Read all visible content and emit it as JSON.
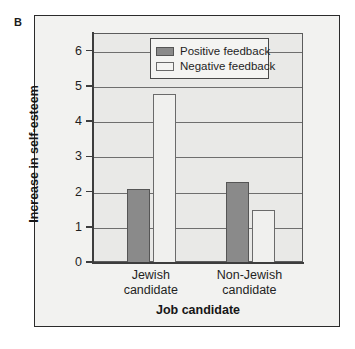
{
  "figure": {
    "panel_label": "B",
    "background_color": "#f2f2f0",
    "frame_color": "#2b2b2b"
  },
  "chart_data": {
    "type": "bar",
    "title": "",
    "panel": "B",
    "categories": [
      "Jewish candidate",
      "Non-Jewish candidate"
    ],
    "category_lines": [
      [
        "Jewish",
        "candidate"
      ],
      [
        "Non-Jewish",
        "candidate"
      ]
    ],
    "series": [
      {
        "name": "Positive feedback",
        "color": "#8a8a8a",
        "values": [
          2.1,
          2.3
        ]
      },
      {
        "name": "Negative feedback",
        "color": "#f0f0ee",
        "values": [
          4.8,
          1.5
        ]
      }
    ],
    "xlabel": "Job candidate",
    "ylabel": "Increase in self-esteem",
    "ylim": [
      0,
      6.5
    ],
    "yticks": [
      0,
      1,
      2,
      3,
      4,
      5,
      6
    ],
    "ytick_labels": [
      "0",
      "1",
      "2",
      "3",
      "4",
      "5",
      "6"
    ],
    "grid": true,
    "grid_axis": "y",
    "legend_position": "top-center",
    "plot_background": "#e9e9e7"
  },
  "legend": {
    "entries": [
      {
        "label": "Positive feedback",
        "swatch": "positive"
      },
      {
        "label": "Negative feedback",
        "swatch": "negative"
      }
    ]
  }
}
